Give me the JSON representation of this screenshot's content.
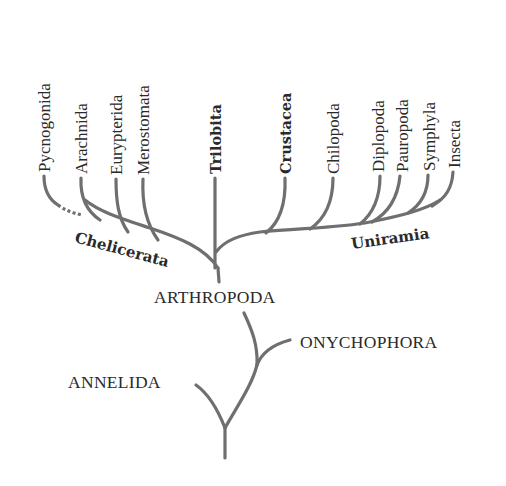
{
  "diagram": {
    "type": "phylogenetic-tree",
    "colors": {
      "branch": "#6f6f6f",
      "text": "#2a2a2a",
      "background": "#ffffff"
    },
    "terminal_taxa": [
      {
        "label": "Pycnogonida",
        "bold": false,
        "connection": "dashed"
      },
      {
        "label": "Arachnida",
        "bold": false
      },
      {
        "label": "Eurypterida",
        "bold": false
      },
      {
        "label": "Merostomata",
        "bold": false
      },
      {
        "label": "Trilobita",
        "bold": true
      },
      {
        "label": "Crustacea",
        "bold": true
      },
      {
        "label": "Chilopoda",
        "bold": false
      },
      {
        "label": "Diplopoda",
        "bold": false
      },
      {
        "label": "Pauropoda",
        "bold": false
      },
      {
        "label": "Symphyla",
        "bold": false
      },
      {
        "label": "Insecta",
        "bold": false
      }
    ],
    "groups": {
      "chelicerata": "Chelicerata",
      "uniramia": "Uniramia"
    },
    "phyla": {
      "arthropoda": "ARTHROPODA",
      "onychophora": "ONYCHOPHORA",
      "annelida": "ANNELIDA"
    }
  }
}
